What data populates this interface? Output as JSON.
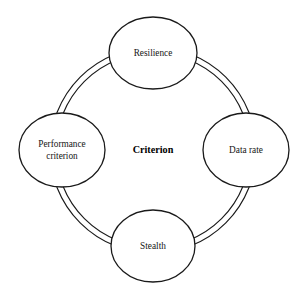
{
  "diagram": {
    "title": "Criterion",
    "type": "circular-ring-diagram",
    "center": {
      "label": "Criterion",
      "style": "bold"
    },
    "background_color": "#ffffff",
    "stroke_color": "#1a1a1a",
    "ring": {
      "style": "double-line",
      "outer_radius": 103,
      "inner_radius": 97,
      "center_x": 153,
      "center_y": 150
    },
    "nodes": [
      {
        "id": "resilience",
        "label": "Resilience",
        "lines": [
          "Resilience"
        ],
        "position": "top",
        "cx": 153,
        "cy": 53,
        "rx": 44,
        "ry": 36
      },
      {
        "id": "data-rate",
        "label": "Data rate",
        "lines": [
          "Data rate"
        ],
        "position": "right",
        "cx": 246,
        "cy": 150,
        "rx": 43,
        "ry": 37
      },
      {
        "id": "stealth",
        "label": "Stealth",
        "lines": [
          "Stealth"
        ],
        "position": "bottom",
        "cx": 153,
        "cy": 246,
        "rx": 42,
        "ry": 36
      },
      {
        "id": "performance-criterion",
        "label": "Performance criterion",
        "lines": [
          "Performance",
          "criterion"
        ],
        "position": "left",
        "cx": 62,
        "cy": 150,
        "rx": 43,
        "ry": 37
      }
    ]
  }
}
